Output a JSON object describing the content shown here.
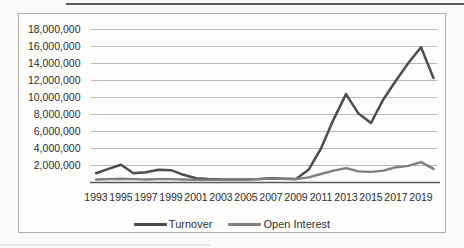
{
  "figure": {
    "background": "#fbfaf8",
    "frame_border_color": "#b3b1ac"
  },
  "chart_data": {
    "type": "line",
    "title": "",
    "xlabel": "",
    "ylabel": "",
    "x_years": [
      1993,
      1994,
      1995,
      1996,
      1997,
      1998,
      1999,
      2000,
      2001,
      2002,
      2003,
      2004,
      2005,
      2006,
      2007,
      2008,
      2009,
      2010,
      2011,
      2012,
      2013,
      2014,
      2015,
      2016,
      2017,
      2018,
      2019,
      2020
    ],
    "x_tick_labels": [
      "1993",
      "1995",
      "1997",
      "1999",
      "2001",
      "2003",
      "2005",
      "2007",
      "2009",
      "2011",
      "2013",
      "2015",
      "2017",
      "2019"
    ],
    "y_tick_labels": [
      "18,000,000",
      "16,000,000",
      "14,000,000",
      "12,000,000",
      "10,000,000",
      "8,000,000",
      "6,000,000",
      "4,000,000",
      "2,000,000"
    ],
    "ylim": [
      0,
      18000000
    ],
    "grid": true,
    "legend_position": "bottom",
    "axis_color": "#595959",
    "gridline_color": "#bdbbb7",
    "label_color": "#2e2e2e",
    "series": [
      {
        "name": "Turnover",
        "color": "#4d4d4d",
        "values": [
          1100000,
          1600000,
          2100000,
          1100000,
          1200000,
          1500000,
          1450000,
          900000,
          500000,
          400000,
          350000,
          350000,
          350000,
          400000,
          500000,
          450000,
          400000,
          1500000,
          4000000,
          7400000,
          10400000,
          8100000,
          7000000,
          9800000,
          12000000,
          14100000,
          15900000,
          12300000
        ]
      },
      {
        "name": "Open Interest",
        "color": "#7f7f7f",
        "values": [
          350000,
          400000,
          450000,
          400000,
          350000,
          400000,
          400000,
          350000,
          300000,
          300000,
          300000,
          300000,
          350000,
          400000,
          450000,
          450000,
          400000,
          600000,
          1000000,
          1400000,
          1700000,
          1300000,
          1250000,
          1400000,
          1800000,
          1950000,
          2400000,
          1600000
        ]
      }
    ]
  }
}
